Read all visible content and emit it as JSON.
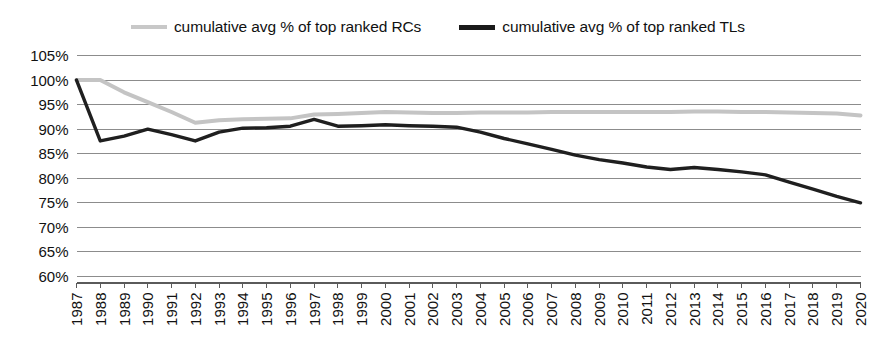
{
  "legend": {
    "position": "top-center",
    "entries": [
      {
        "key": "rc",
        "label": "cumulative avg % of top ranked RCs",
        "color": "#c4c4c4",
        "icon": "line-swatch-icon"
      },
      {
        "key": "tl",
        "label": "cumulative avg % of top ranked TLs",
        "color": "#1f1f1f",
        "icon": "line-swatch-icon"
      }
    ]
  },
  "chart_data": {
    "type": "line",
    "title": "",
    "xlabel": "",
    "ylabel": "",
    "grid": true,
    "legend_position": "top-center",
    "ylim": [
      60,
      105
    ],
    "ytick_step": 5,
    "ytick_labels": [
      "105%",
      "100%",
      "95%",
      "90%",
      "85%",
      "80%",
      "75%",
      "70%",
      "65%",
      "60%"
    ],
    "ytick_values": [
      105,
      100,
      95,
      90,
      85,
      80,
      75,
      70,
      65,
      60
    ],
    "categories": [
      "1987",
      "1988",
      "1989",
      "1990",
      "1991",
      "1992",
      "1993",
      "1994",
      "1995",
      "1996",
      "1997",
      "1998",
      "1999",
      "2000",
      "2001",
      "2002",
      "2003",
      "2004",
      "2005",
      "2006",
      "2007",
      "2008",
      "2009",
      "2010",
      "2011",
      "2012",
      "2013",
      "2014",
      "2015",
      "2016",
      "2017",
      "2018",
      "2019",
      "2020"
    ],
    "series": [
      {
        "name": "cumulative avg % of top ranked RCs",
        "color": "#c4c4c4",
        "values": [
          100.0,
          100.0,
          97.5,
          95.5,
          93.5,
          91.3,
          91.8,
          92.0,
          92.1,
          92.2,
          93.0,
          93.1,
          93.3,
          93.5,
          93.4,
          93.3,
          93.3,
          93.4,
          93.4,
          93.4,
          93.5,
          93.5,
          93.5,
          93.5,
          93.5,
          93.5,
          93.6,
          93.6,
          93.5,
          93.5,
          93.4,
          93.3,
          93.2,
          92.8
        ]
      },
      {
        "name": "cumulative avg % of top ranked TLs",
        "color": "#1f1f1f",
        "values": [
          100.0,
          87.6,
          88.6,
          90.0,
          88.9,
          87.6,
          89.4,
          90.2,
          90.3,
          90.6,
          92.0,
          90.6,
          90.7,
          90.9,
          90.7,
          90.6,
          90.4,
          89.4,
          88.1,
          87.0,
          85.9,
          84.7,
          83.8,
          83.1,
          82.3,
          81.8,
          82.2,
          81.8,
          81.3,
          80.7,
          79.2,
          77.8,
          76.3,
          75.0
        ]
      }
    ]
  }
}
